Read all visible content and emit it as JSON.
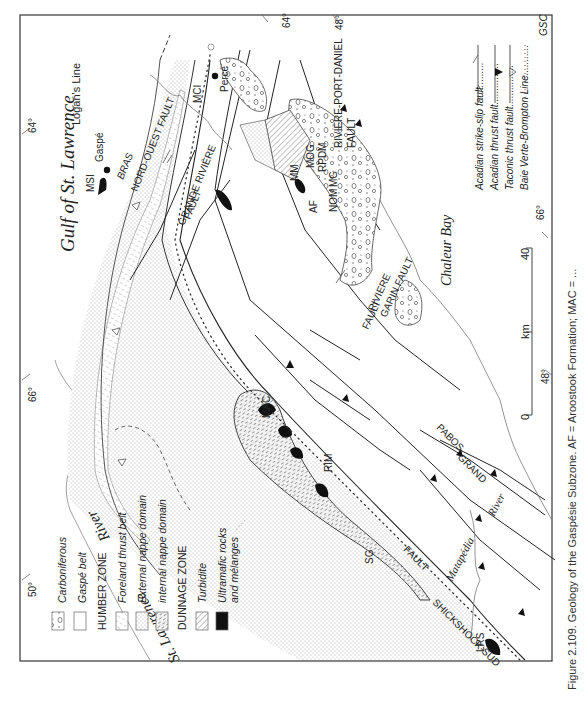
{
  "figure": {
    "caption": "Figure 2.109. Geology of the Gaspésie Subzone. AF = Aroostook Formation; MAC = ...",
    "credit": "GSC"
  },
  "map": {
    "water_labels": {
      "gulf": "Gulf of St. Lawrence",
      "chaleur": "Chaleur Bay",
      "st_lawrence_river_1": "St. Lawrence",
      "st_lawrence_river_2": "River",
      "matapedia_1": "Matapédia",
      "matapedia_2": "River"
    },
    "coordinates": {
      "lon_64_top": "64°",
      "lon_64_left": "64°",
      "lat_48_top": "48°",
      "lon_66_bottom": "66°",
      "lat_50_bottom": "50°",
      "lon_66_right": "66°",
      "lat_48_right": "48°"
    },
    "places": {
      "gaspe": "Gaspé",
      "perce": "Percé"
    },
    "lines": {
      "logans_line": "Logan's Line"
    },
    "faults": {
      "bras_1": "BRAS",
      "bras_2": "NORD-OUEST FAULT",
      "grande_riviere_1": "GRANDE RIVIÈRE",
      "grande_riviere_2": "FAULT",
      "riviere_port_daniel_1": "RIVIÈRE-PORT-DANIEL",
      "riviere_port_daniel_2": "FAULT",
      "riviere_garin_1": "RIVIERE",
      "riviere_garin_2": "GARIN FAULT",
      "fault_left": "FAULT",
      "grand_pabos_1": "GRAND",
      "grand_pabos_2": "PABOS",
      "shickshock_1": "SHICKSHOCK-SUD",
      "shickshock_2": "FAULT"
    },
    "units": {
      "msi": "MSI",
      "mci": "MCI",
      "mm": "MM",
      "af": "AF",
      "mog": "MOG",
      "rpdm": "RPDM",
      "nom": "NOM",
      "mg": "MG",
      "mac": "MAC",
      "rim": "RIM",
      "sg": "SG",
      "lrs": "LRS"
    },
    "scale": {
      "zero": "0",
      "forty": "40",
      "unit": "km"
    }
  },
  "legend_units": {
    "items": [
      {
        "label": "Carboniferous",
        "italic": true,
        "pattern": "conglomerate"
      },
      {
        "label": "Gaspé belt",
        "italic": true,
        "pattern": "blank"
      },
      {
        "label": "HUMBER ZONE",
        "italic": false,
        "pattern": "header"
      },
      {
        "label": "Foreland thrust belt",
        "italic": true,
        "pattern": "hatch-light"
      },
      {
        "label": "External nappe domain",
        "italic": true,
        "pattern": "dots-fine"
      },
      {
        "label": "internal nappe domain",
        "italic": true,
        "pattern": "dashes"
      },
      {
        "label": "DUNNAGE ZONE",
        "italic": false,
        "pattern": "header"
      },
      {
        "label": "Turbidite",
        "italic": true,
        "pattern": "hatch-diag"
      },
      {
        "label": "Ultramafic rocks",
        "italic": true,
        "pattern": "solid"
      },
      {
        "label": "and mélanges",
        "italic": true,
        "pattern": "none"
      }
    ]
  },
  "legend_lines": {
    "items": [
      {
        "label": "Acadian strike-slip fault.........",
        "symbol": "strike-slip"
      },
      {
        "label": "Acadian thrust fault...............",
        "symbol": "thrust-filled"
      },
      {
        "label": "Taconic thrust fault...............",
        "symbol": "thrust-open"
      },
      {
        "label": "Baie Verte-Brompton Line...........",
        "symbol": "dotted"
      }
    ]
  },
  "colors": {
    "ink": "#222222",
    "frame": "#444444",
    "pattern_gray": "#9a9a9a",
    "fill_dots": "#e9e9e9"
  }
}
